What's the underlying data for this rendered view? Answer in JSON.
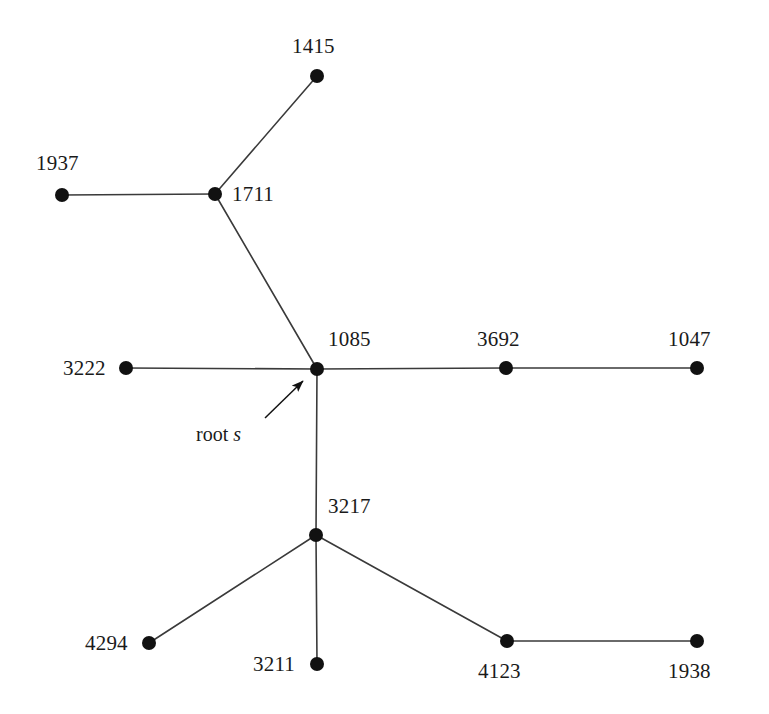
{
  "figure": {
    "type": "tree-graph",
    "background_color": "#ffffff",
    "node_color": "#111111",
    "edge_color": "#3a3a3a",
    "label_color": "#1a1a1a",
    "node_radius": 7,
    "edge_width": 1.6,
    "width": 769,
    "height": 714
  },
  "nodes": [
    {
      "id": "1415",
      "label": "1415",
      "x": 317,
      "y": 76,
      "label_x": 292,
      "label_y": 36,
      "label_pos": "above"
    },
    {
      "id": "1711",
      "label": "1711",
      "x": 215,
      "y": 194,
      "label_x": 232,
      "label_y": 184,
      "label_pos": "right"
    },
    {
      "id": "1937",
      "label": "1937",
      "x": 62,
      "y": 195,
      "label_x": 36,
      "label_y": 153,
      "label_pos": "above-left"
    },
    {
      "id": "1085",
      "label": "1085",
      "x": 317,
      "y": 369,
      "label_x": 328,
      "label_y": 329,
      "label_pos": "above-right"
    },
    {
      "id": "3222",
      "label": "3222",
      "x": 126,
      "y": 368,
      "label_x": 63,
      "label_y": 358,
      "label_pos": "left"
    },
    {
      "id": "3692",
      "label": "3692",
      "x": 506,
      "y": 368,
      "label_x": 477,
      "label_y": 329,
      "label_pos": "above"
    },
    {
      "id": "1047",
      "label": "1047",
      "x": 697,
      "y": 368,
      "label_x": 668,
      "label_y": 329,
      "label_pos": "above"
    },
    {
      "id": "3217",
      "label": "3217",
      "x": 316,
      "y": 535,
      "label_x": 328,
      "label_y": 496,
      "label_pos": "above-right"
    },
    {
      "id": "4294",
      "label": "4294",
      "x": 149,
      "y": 643,
      "label_x": 85,
      "label_y": 633,
      "label_pos": "left"
    },
    {
      "id": "3211",
      "label": "3211",
      "x": 317,
      "y": 664,
      "label_x": 253,
      "label_y": 654,
      "label_pos": "left"
    },
    {
      "id": "4123",
      "label": "4123",
      "x": 507,
      "y": 641,
      "label_x": 478,
      "label_y": 661,
      "label_pos": "below"
    },
    {
      "id": "1938",
      "label": "1938",
      "x": 697,
      "y": 641,
      "label_x": 668,
      "label_y": 661,
      "label_pos": "below"
    }
  ],
  "edges": [
    {
      "from": "1415",
      "to": "1711"
    },
    {
      "from": "1937",
      "to": "1711"
    },
    {
      "from": "1711",
      "to": "1085"
    },
    {
      "from": "3222",
      "to": "1085"
    },
    {
      "from": "1085",
      "to": "3692"
    },
    {
      "from": "3692",
      "to": "1047"
    },
    {
      "from": "1085",
      "to": "3217"
    },
    {
      "from": "3217",
      "to": "4294"
    },
    {
      "from": "3217",
      "to": "3211"
    },
    {
      "from": "3217",
      "to": "4123"
    },
    {
      "from": "4123",
      "to": "1938"
    }
  ],
  "annotations": [
    {
      "id": "root-annotation",
      "text_prefix": "root ",
      "text_italic": "s",
      "text_full": "root s",
      "label_x": 196,
      "label_y": 424,
      "arrow": {
        "x1": 265,
        "y1": 418,
        "x2": 303,
        "y2": 381
      },
      "points_to": "1085"
    }
  ],
  "chart_data": {
    "type": "diagram",
    "title": "",
    "node_ids": [
      "1415",
      "1711",
      "1937",
      "1085",
      "3222",
      "3692",
      "1047",
      "3217",
      "4294",
      "3211",
      "4123",
      "1938"
    ],
    "edge_list": [
      [
        "1415",
        "1711"
      ],
      [
        "1937",
        "1711"
      ],
      [
        "1711",
        "1085"
      ],
      [
        "3222",
        "1085"
      ],
      [
        "1085",
        "3692"
      ],
      [
        "3692",
        "1047"
      ],
      [
        "1085",
        "3217"
      ],
      [
        "3217",
        "4294"
      ],
      [
        "3217",
        "3211"
      ],
      [
        "3217",
        "4123"
      ],
      [
        "4123",
        "1938"
      ]
    ],
    "root": "1085",
    "root_annotation": "root s"
  }
}
